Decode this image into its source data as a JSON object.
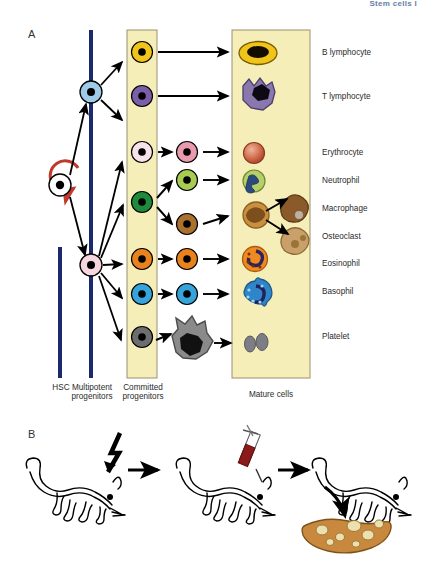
{
  "figure": {
    "top_right_header": "Stem cells I",
    "panels": [
      {
        "letter": "A",
        "name": "hematopoiesis-panel"
      },
      {
        "letter": "B",
        "name": "transplant-panel"
      }
    ]
  },
  "panelA": {
    "column_headers": [
      {
        "id": "hsc",
        "label": "HSC"
      },
      {
        "id": "multipotent",
        "label": "Multipotent\nprogenitors",
        "line1": "Multipotent",
        "line2": "progenitors"
      },
      {
        "id": "committed",
        "label": "Committed\nprogenitors",
        "line1": "Committed",
        "line2": "progenitors"
      },
      {
        "id": "mature",
        "label": "Mature cells"
      }
    ],
    "cell_labels": [
      {
        "id": "b-lymphocyte",
        "label": "B lymphocyte",
        "y": 57
      },
      {
        "id": "t-lymphocyte",
        "label": "T lymphocyte",
        "y": 101
      },
      {
        "id": "erythrocyte",
        "label": "Erythrocyte",
        "y": 155
      },
      {
        "id": "neutrophil",
        "label": "Neutrophil",
        "y": 183
      },
      {
        "id": "macrophage",
        "label": "Macrophage",
        "y": 210
      },
      {
        "id": "osteoclast",
        "label": "Osteoclast",
        "y": 238
      },
      {
        "id": "eosinophil",
        "label": "Eosinophil",
        "y": 265
      },
      {
        "id": "basophil",
        "label": "Basophil",
        "y": 293
      },
      {
        "id": "platelet",
        "label": "Platelet",
        "y": 338
      }
    ],
    "stem_cell": {
      "id": "hsc-cell",
      "fill": "#ffffff",
      "nucleus": "#000000"
    },
    "self_renewal_arrow": {
      "id": "self-renewal-arrow",
      "color": "#c0392b"
    },
    "multipotent_progenitors": [
      {
        "id": "mpp-lymphoid",
        "fill": "#9ecbe8",
        "nucleus": "#000000"
      },
      {
        "id": "mpp-myeloid",
        "fill": "#f6d7dd",
        "nucleus": "#000000"
      }
    ],
    "committed_progenitors": [
      {
        "id": "cp-b-cell",
        "fill": "#f0c419"
      },
      {
        "id": "cp-t-cell",
        "fill": "#7b5ea7"
      },
      {
        "id": "cp-erythroid",
        "fill": "#f6e3ea"
      },
      {
        "id": "cp-granulocyte-monocyte",
        "fill": "#1f8a3c"
      },
      {
        "id": "cp-eosinophil",
        "fill": "#e8821e"
      },
      {
        "id": "cp-basophil",
        "fill": "#35a3dc"
      },
      {
        "id": "cp-megakaryocyte",
        "fill": "#6d6d6d"
      }
    ],
    "precursors": [
      {
        "id": "pre-erythroblast",
        "fill": "#ea9aae"
      },
      {
        "id": "pre-neutrophil",
        "fill": "#a8cb52"
      },
      {
        "id": "pre-monocyte",
        "fill": "#a9702e"
      },
      {
        "id": "pre-eosinophil",
        "fill": "#e8821e"
      },
      {
        "id": "pre-basophil",
        "fill": "#35a3dc"
      },
      {
        "id": "pre-megakaryocyte",
        "fill": "#8a8a8a"
      }
    ],
    "mature_cells": [
      {
        "id": "mature-b-lymphocyte",
        "fill": "#f0c419",
        "nucleus": "#000000"
      },
      {
        "id": "mature-t-lymphocyte",
        "fill": "#8878ad",
        "nucleus": "#000000"
      },
      {
        "id": "mature-erythrocyte",
        "fill": "#c4553c"
      },
      {
        "id": "mature-neutrophil",
        "fill": "#b5cf6b"
      },
      {
        "id": "mature-monocyte",
        "fill": "#c9903f"
      },
      {
        "id": "mature-macrophage",
        "fill": "#8a5a2b"
      },
      {
        "id": "mature-osteoclast",
        "fill": "#c9a06a"
      },
      {
        "id": "mature-eosinophil",
        "fill": "#ef8a21"
      },
      {
        "id": "mature-basophil",
        "fill": "#2e86c8"
      },
      {
        "id": "mature-platelet",
        "fill": "#7d7d85"
      }
    ],
    "colors": {
      "lineage_bar": "#1a2a6c",
      "column_fill": "#f5eeb8",
      "column_stroke": "#9a9070",
      "arrow": "#000000"
    }
  },
  "panelB": {
    "steps": [
      {
        "id": "step-irradiation",
        "icon": "lightning-bolt-icon"
      },
      {
        "id": "step-injection",
        "icon": "syringe-icon"
      },
      {
        "id": "step-colonies",
        "icon": "spleen-icon"
      }
    ],
    "colors": {
      "mouse_outline": "#000000",
      "syringe_blood": "#8b1a1a",
      "spleen_fill": "#c8893f",
      "spleen_colony": "#eddfae"
    }
  }
}
